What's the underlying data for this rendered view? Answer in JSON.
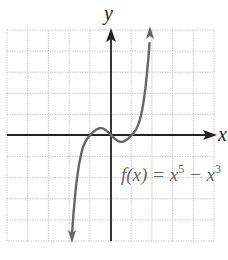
{
  "chart_data": {
    "type": "line",
    "title": "",
    "xlabel": "x",
    "ylabel": "y",
    "xlim": [
      -5,
      5
    ],
    "ylim": [
      -5,
      5
    ],
    "grid": true,
    "grid_step": 1,
    "legend": null,
    "annotations": [
      {
        "text": "f(x) = x^5 - x^3",
        "position": "right-center below x-axis"
      }
    ],
    "series": [
      {
        "name": "f(x) = x^5 - x^3",
        "function": "x^5 - x^3",
        "color": "#666666",
        "arrows": "both ends",
        "x_range": [
          -1.9,
          1.9
        ],
        "zeros": [
          -1,
          0,
          1
        ]
      }
    ]
  },
  "labels": {
    "x_axis": "x",
    "y_axis": "y",
    "function_prefix": "f(x) = x",
    "exp1": "5",
    "minus": " − x",
    "exp2": "3"
  },
  "colors": {
    "grid": "#c8c8c8",
    "axis": "#222222",
    "curve": "#666666"
  }
}
